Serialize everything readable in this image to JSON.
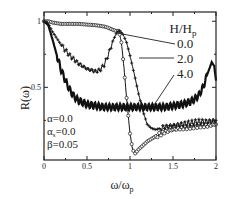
{
  "chart_data": {
    "type": "line",
    "title": "",
    "xlabel": "ω/ω_p",
    "ylabel": "R(ω)",
    "xlim": [
      0,
      2
    ],
    "ylim": [
      -0.05,
      1.07
    ],
    "grid": false,
    "x_ticks": [
      {
        "value": 0,
        "label": "0"
      },
      {
        "value": 0.5,
        "label": "0.5"
      },
      {
        "value": 1,
        "label": "1"
      },
      {
        "value": 1.5,
        "label": "1.5"
      },
      {
        "value": 2,
        "label": "2"
      }
    ],
    "y_ticks": [
      {
        "value": 0.5,
        "label": "0.5"
      },
      {
        "value": 1,
        "label": "1"
      }
    ],
    "legend": {
      "title": "H/H",
      "title_sub": "p",
      "position": "upper right (inside, with leader lines)",
      "entries": [
        "0.0",
        "2.0",
        "4.0"
      ]
    },
    "annotations": [
      {
        "text": "α=0.0"
      },
      {
        "text": "α",
        "sub": "s",
        "rest": "=0.0"
      },
      {
        "text": "β=0.05"
      }
    ],
    "series": [
      {
        "name": "H/Hp = 0.0",
        "marker": "open circle",
        "x": [
          0.0,
          0.05,
          0.1,
          0.2,
          0.3,
          0.4,
          0.5,
          0.6,
          0.7,
          0.75,
          0.8,
          0.85,
          0.87,
          0.9,
          0.93,
          0.96,
          1.0,
          1.03,
          1.06,
          1.1,
          1.2,
          1.3,
          1.4,
          1.5,
          1.6,
          1.7,
          1.8,
          1.9,
          2.0
        ],
        "values": [
          1.0,
          1.0,
          0.99,
          0.98,
          0.98,
          0.98,
          0.975,
          0.97,
          0.96,
          0.95,
          0.935,
          0.925,
          0.93,
          0.84,
          0.65,
          0.42,
          0.15,
          0.03,
          0.0,
          0.03,
          0.09,
          0.13,
          0.16,
          0.18,
          0.19,
          0.2,
          0.21,
          0.21,
          0.22
        ]
      },
      {
        "name": "H/Hp = 2.0",
        "marker": "plus",
        "x": [
          0.0,
          0.05,
          0.1,
          0.2,
          0.3,
          0.4,
          0.5,
          0.6,
          0.65,
          0.7,
          0.75,
          0.8,
          0.85,
          0.88,
          0.92,
          0.96,
          1.0,
          1.05,
          1.1,
          1.15,
          1.2,
          1.25,
          1.3,
          1.4,
          1.5,
          1.6,
          1.7,
          1.8,
          1.9,
          2.0
        ],
        "values": [
          1.0,
          0.98,
          0.92,
          0.82,
          0.74,
          0.68,
          0.64,
          0.62,
          0.63,
          0.67,
          0.75,
          0.85,
          0.92,
          0.93,
          0.9,
          0.84,
          0.74,
          0.6,
          0.45,
          0.32,
          0.22,
          0.19,
          0.18,
          0.2,
          0.21,
          0.22,
          0.23,
          0.24,
          0.24,
          0.25
        ]
      },
      {
        "name": "H/Hp = 4.0",
        "marker": "none (thick oscillating line)",
        "x": [
          0.0,
          0.05,
          0.1,
          0.15,
          0.2,
          0.25,
          0.3,
          0.35,
          0.4,
          0.5,
          0.6,
          0.7,
          0.8,
          0.9,
          1.0,
          1.1,
          1.2,
          1.3,
          1.4,
          1.5,
          1.6,
          1.7,
          1.75,
          1.8,
          1.85,
          1.9,
          1.95,
          1.98,
          2.0
        ],
        "values": [
          1.0,
          0.97,
          0.86,
          0.74,
          0.63,
          0.55,
          0.48,
          0.43,
          0.4,
          0.37,
          0.36,
          0.35,
          0.35,
          0.35,
          0.35,
          0.35,
          0.35,
          0.35,
          0.35,
          0.36,
          0.37,
          0.39,
          0.41,
          0.44,
          0.5,
          0.6,
          0.69,
          0.66,
          0.55
        ]
      }
    ]
  }
}
